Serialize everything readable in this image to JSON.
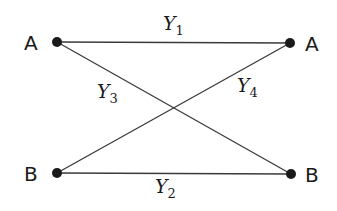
{
  "diagram": {
    "nodes": [
      {
        "id": "A_left",
        "label": "A",
        "x": 57,
        "y": 42
      },
      {
        "id": "A_right",
        "label": "A",
        "x": 290,
        "y": 43
      },
      {
        "id": "B_left",
        "label": "B",
        "x": 57,
        "y": 173
      },
      {
        "id": "B_right",
        "label": "B",
        "x": 291,
        "y": 174
      }
    ],
    "edges": [
      {
        "from": "A_left",
        "to": "A_right",
        "label": "Y",
        "sub": "1"
      },
      {
        "from": "B_left",
        "to": "B_right",
        "label": "Y",
        "sub": "2"
      },
      {
        "from": "A_left",
        "to": "B_right",
        "label": "Y",
        "sub": "3"
      },
      {
        "from": "B_left",
        "to": "A_right",
        "label": "Y",
        "sub": "4"
      }
    ]
  }
}
